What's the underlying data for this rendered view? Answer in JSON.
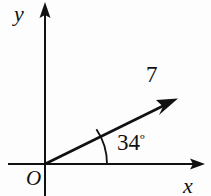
{
  "figure": {
    "background_color": "#fdfdfd",
    "ink_color": "#111111",
    "width": 211,
    "height": 196
  },
  "axes": {
    "y_label": "y",
    "x_label": "x",
    "origin_label": "O",
    "origin_px": [
      45,
      164
    ],
    "x_axis_from_px": [
      8,
      164
    ],
    "x_axis_to_px": [
      205,
      164
    ],
    "y_axis_from_px": [
      45,
      196
    ],
    "y_axis_to_px": [
      45,
      3
    ]
  },
  "vector": {
    "magnitude_label": "7",
    "magnitude_value": 7,
    "angle_label": "34º",
    "angle_number": "34",
    "angle_degree_symbol": "º",
    "angle_value_deg": 34,
    "tail_px": [
      45,
      164
    ],
    "tip_px": [
      177,
      99
    ]
  },
  "angle_arc": {
    "radius_px": 62,
    "from_deg": 0,
    "to_deg": 34
  }
}
